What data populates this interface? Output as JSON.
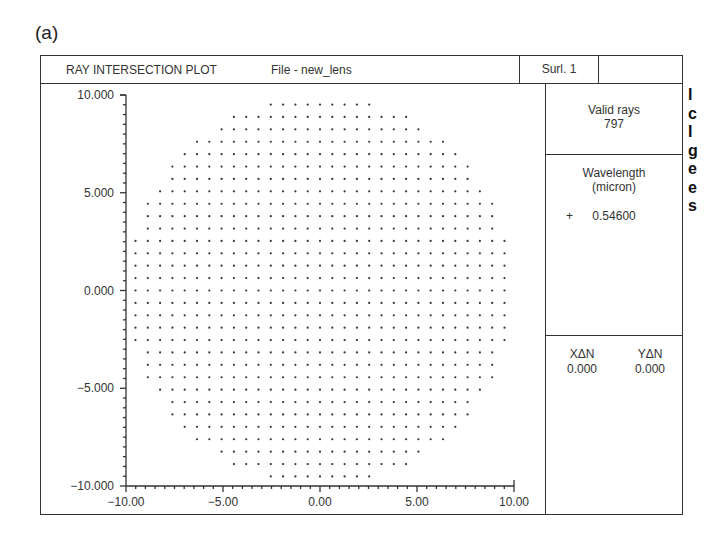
{
  "figure_label": "(a)",
  "header": {
    "title": "RAY INTERSECTION PLOT",
    "file": "File - new_lens",
    "surface": "Surl. 1"
  },
  "side_panel": {
    "valid_rays_label": "Valid rays",
    "valid_rays_value": "797",
    "wavelength_label": "Wavelength",
    "wavelength_unit": "(micron)",
    "wavelength_marker": "+",
    "wavelength_value": "0.54600",
    "x_delta_label": "XΔN",
    "x_delta_value": "0.000",
    "y_delta_label": "YΔN",
    "y_delta_value": "0.000"
  },
  "axes": {
    "x_ticks": [
      "-10.00",
      "-5.00",
      "0.00",
      "5.00",
      "10.00"
    ],
    "y_ticks": [
      "10.000",
      "5.000",
      "0.000",
      "-5.000",
      "-10.000"
    ]
  },
  "plot": {
    "type": "scatter",
    "description": "Spot grid of ray intersections filling a circular aperture of radius ~10",
    "grid_spacing": 0.634,
    "aperture_radius": 10.0,
    "xlim": [
      -10,
      10
    ],
    "ylim": [
      -10,
      10
    ],
    "valid_rays": 797,
    "dot_color": "#333333"
  },
  "right_fragments": [
    "I",
    "c",
    "I",
    "g",
    "e",
    "e",
    "s"
  ]
}
